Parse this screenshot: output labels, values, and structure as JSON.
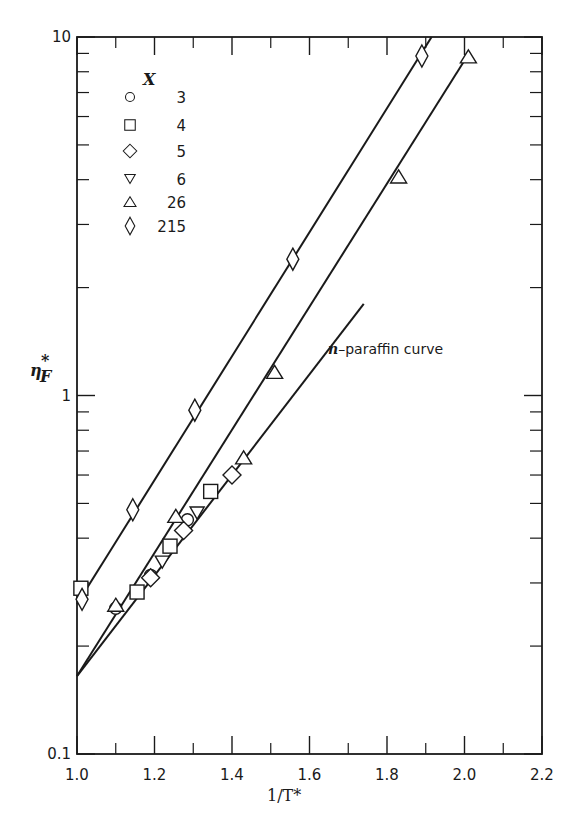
{
  "chart_data": {
    "type": "scatter",
    "title": "",
    "xlabel": "1/T*",
    "ylabel": "η*_F",
    "ylabel_main": "η",
    "ylabel_sup": "*",
    "ylabel_sub": "F",
    "xlim": [
      1.0,
      2.2
    ],
    "ylim": [
      0.1,
      10
    ],
    "yscale": "log",
    "grid": false,
    "x_ticks_major": [
      1.0,
      1.2,
      1.4,
      1.6,
      1.8,
      2.0,
      2.2
    ],
    "x_tick_labels": [
      "1.0",
      "1.2",
      "1.4",
      "1.6",
      "1.8",
      "2.0",
      "2.2"
    ],
    "x_ticks_minor": [
      1.1,
      1.3,
      1.5,
      1.7,
      1.9,
      2.1
    ],
    "y_tick_labels": [
      {
        "value": 0.1,
        "label": "0.1"
      },
      {
        "value": 1,
        "label": "1"
      },
      {
        "value": 10,
        "label": "10"
      }
    ],
    "legend": {
      "title": "X",
      "placement": "top-left",
      "entries": [
        {
          "marker": "circle",
          "label": "3"
        },
        {
          "marker": "square",
          "label": "4"
        },
        {
          "marker": "diamond",
          "label": "5"
        },
        {
          "marker": "triangle-down",
          "label": "6"
        },
        {
          "marker": "triangle-up",
          "label": "26"
        },
        {
          "marker": "tall-diamond",
          "label": "215"
        }
      ]
    },
    "series": [
      {
        "name": "3",
        "marker": "circle",
        "points": [
          [
            1.1,
            0.255
          ],
          [
            1.19,
            0.315
          ],
          [
            1.285,
            0.45
          ]
        ]
      },
      {
        "name": "4",
        "marker": "square",
        "points": [
          [
            1.01,
            0.29
          ],
          [
            1.155,
            0.283
          ],
          [
            1.24,
            0.38
          ],
          [
            1.345,
            0.54
          ]
        ]
      },
      {
        "name": "5",
        "marker": "diamond",
        "points": [
          [
            1.19,
            0.31
          ],
          [
            1.275,
            0.42
          ],
          [
            1.4,
            0.6
          ]
        ]
      },
      {
        "name": "6",
        "marker": "triangle-down",
        "points": [
          [
            1.22,
            0.343
          ],
          [
            1.31,
            0.47
          ]
        ]
      },
      {
        "name": "26",
        "marker": "triangle-up",
        "points": [
          [
            1.1,
            0.26
          ],
          [
            1.255,
            0.46
          ],
          [
            1.43,
            0.67
          ],
          [
            1.51,
            1.16
          ],
          [
            1.83,
            4.07
          ],
          [
            2.01,
            8.8
          ]
        ]
      },
      {
        "name": "215",
        "marker": "tall-diamond",
        "points": [
          [
            1.013,
            0.27
          ],
          [
            1.144,
            0.48
          ],
          [
            1.304,
            0.91
          ],
          [
            1.557,
            2.4
          ],
          [
            1.89,
            8.85
          ]
        ]
      }
    ],
    "lines": [
      {
        "name": "X=215 fit",
        "from": [
          1.0,
          0.262
        ],
        "to": [
          1.915,
          10
        ]
      },
      {
        "name": "X=26 fit",
        "from": [
          1.0,
          0.165
        ],
        "to": [
          2.0,
          8.6
        ]
      },
      {
        "name": "n-paraffin curve",
        "from": [
          1.0,
          0.165
        ],
        "to": [
          1.74,
          1.8
        ]
      }
    ],
    "annotations": [
      {
        "text_italic": "n",
        "text": "–paraffin curve",
        "x": 1.74,
        "y": 1.45
      }
    ]
  }
}
